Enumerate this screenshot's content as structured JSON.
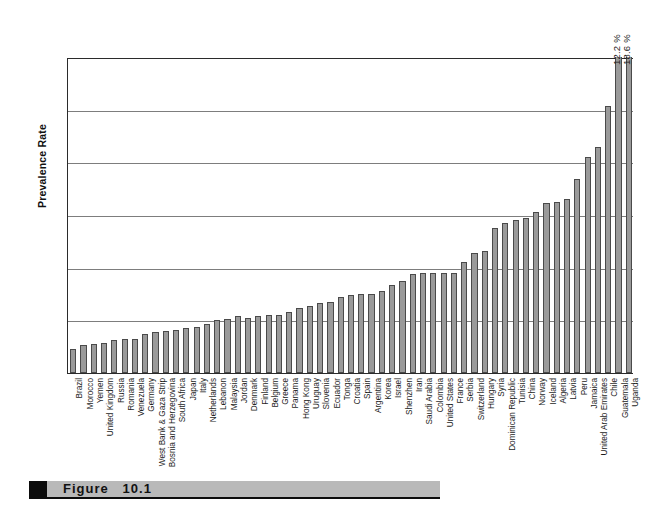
{
  "figure": {
    "caption_label": "Figure",
    "caption_number": "10.1"
  },
  "chart_data": {
    "type": "bar",
    "title": "",
    "xlabel": "",
    "ylabel": "Prevalence Rate",
    "ylim": [
      0,
      12
    ],
    "yunit": "%",
    "ytick_labels": [
      "0%",
      "2%",
      "4%",
      "6%",
      "8%",
      "10%",
      "12%"
    ],
    "ytick_values": [
      0,
      2,
      4,
      6,
      8,
      10,
      12
    ],
    "grid": "horizontal",
    "legend": "none",
    "clipped_note": "Last two bars exceed the 12% axis maximum and are labeled with their values above the plot area.",
    "categories": [
      "Brazil",
      "Morocco",
      "Yemen",
      "United Kingdom",
      "Russia",
      "Romania",
      "Venezuela",
      "Germany",
      "West Bank & Gaza Strip",
      "Bosnia and Herzegovina",
      "South Africa",
      "Japan",
      "Italy",
      "Netherlands",
      "Lebanon",
      "Malaysia",
      "Jordan",
      "Denmark",
      "Finland",
      "Belgium",
      "Greece",
      "Panama",
      "Hong Kong",
      "Uruguay",
      "Slovenia",
      "Ecuador",
      "Tonga",
      "Croatia",
      "Spain",
      "Argentina",
      "Korea",
      "Israel",
      "Shenzhen",
      "Iran",
      "Saudi Arabia",
      "Colombia",
      "United States",
      "France",
      "Serbia",
      "Switzerland",
      "Hungary",
      "Syria",
      "Dominican Republic",
      "Tunisia",
      "China",
      "Norway",
      "Iceland",
      "Algeria",
      "Latvia",
      "Peru",
      "Jamaica",
      "United Arab Emirates",
      "Chile",
      "Guatemala",
      "Uganda"
    ],
    "values": [
      0.9,
      1.05,
      1.1,
      1.15,
      1.25,
      1.3,
      1.3,
      1.5,
      1.55,
      1.6,
      1.65,
      1.7,
      1.75,
      1.85,
      2.0,
      2.05,
      2.15,
      2.1,
      2.15,
      2.2,
      2.2,
      2.3,
      2.45,
      2.55,
      2.65,
      2.7,
      2.9,
      2.95,
      3.0,
      3.0,
      3.1,
      3.35,
      3.5,
      3.75,
      3.8,
      3.8,
      3.8,
      3.8,
      4.2,
      4.55,
      4.65,
      5.5,
      5.7,
      5.8,
      5.9,
      6.1,
      6.45,
      6.5,
      6.6,
      7.35,
      8.2,
      8.6,
      10.15,
      12.2,
      18.6
    ],
    "value_labels": [
      {
        "category": "Guatemala",
        "text": "12.2 %"
      },
      {
        "category": "Uganda",
        "text": "18.6 %"
      }
    ]
  }
}
